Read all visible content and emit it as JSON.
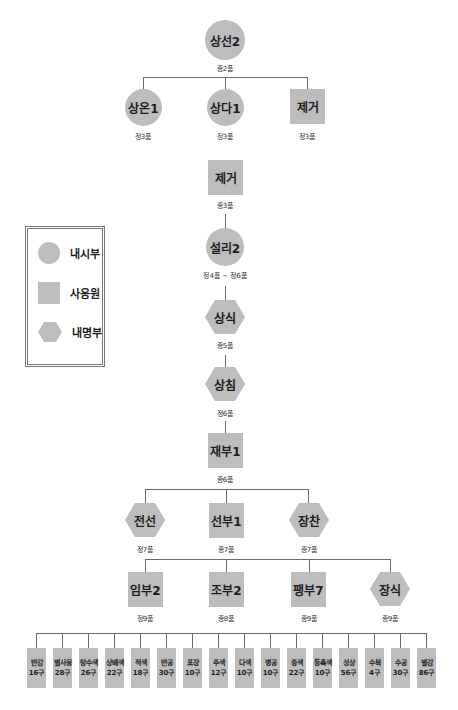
{
  "title_fragment": "",
  "legend": {
    "items": [
      {
        "shape": "circle",
        "label": "내시부"
      },
      {
        "shape": "square",
        "label": "사옹원"
      },
      {
        "shape": "hexagon",
        "label": "내명부"
      }
    ]
  },
  "nodes": {
    "sangseon": {
      "name": "상선2",
      "rank": "종2품",
      "shape": "circle"
    },
    "sangon": {
      "name": "상온1",
      "rank": "정3품",
      "shape": "circle"
    },
    "sangda": {
      "name": "상다1",
      "rank": "정3품",
      "shape": "circle"
    },
    "jegeo1": {
      "name": "제거",
      "rank": "정3품",
      "shape": "square"
    },
    "jegeo2": {
      "name": "제거",
      "rank": "종3품",
      "shape": "square"
    },
    "seolli": {
      "name": "설리2",
      "rank": "정4품 ~ 정6품",
      "shape": "circle"
    },
    "sangsik": {
      "name": "상식",
      "rank": "종5품",
      "shape": "hexagon"
    },
    "sangchim": {
      "name": "상침",
      "rank": "정6품",
      "shape": "hexagon"
    },
    "jaebu": {
      "name": "재부1",
      "rank": "종6품",
      "shape": "square"
    },
    "jeonseon": {
      "name": "전선",
      "rank": "정7품",
      "shape": "hexagon"
    },
    "seonbu": {
      "name": "선부1",
      "rank": "종7품",
      "shape": "square"
    },
    "jangchan": {
      "name": "장찬",
      "rank": "종7품",
      "shape": "hexagon"
    },
    "imbu": {
      "name": "임부2",
      "rank": "정9품",
      "shape": "square"
    },
    "jobu": {
      "name": "조부2",
      "rank": "종8품",
      "shape": "square"
    },
    "paengbu": {
      "name": "팽부7",
      "rank": "종9품",
      "shape": "square"
    },
    "jangsik": {
      "name": "장식",
      "rank": "종9품",
      "shape": "hexagon"
    }
  },
  "leaves": [
    {
      "name": "반감",
      "count": "16구"
    },
    {
      "name": "별사옹",
      "count": "28구"
    },
    {
      "name": "탕수색",
      "count": "26구"
    },
    {
      "name": "상배색",
      "count": "22구"
    },
    {
      "name": "적색",
      "count": "18구"
    },
    {
      "name": "반공",
      "count": "30구"
    },
    {
      "name": "포장",
      "count": "10구"
    },
    {
      "name": "주색",
      "count": "12구"
    },
    {
      "name": "다색",
      "count": "10구"
    },
    {
      "name": "병공",
      "count": "10구"
    },
    {
      "name": "증색",
      "count": "22구"
    },
    {
      "name": "등촉색",
      "count": "10구"
    },
    {
      "name": "성상",
      "count": "56구"
    },
    {
      "name": "수복",
      "count": "4구"
    },
    {
      "name": "수공",
      "count": "30구"
    },
    {
      "name": "별감",
      "count": "86구"
    }
  ]
}
